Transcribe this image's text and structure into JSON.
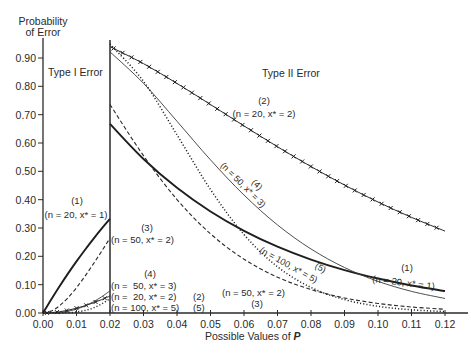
{
  "chart_data": {
    "type": "line",
    "title": "",
    "ylabel": "Probability of Error",
    "xlabel": "Possible Values of P",
    "xlim": [
      0,
      0.12
    ],
    "ylim": [
      0,
      0.9
    ],
    "grid": false,
    "legend": "inline annotations",
    "x_ticks": [
      "0.00",
      "0.01",
      "0.02",
      "0.03",
      "0.04",
      "0.05",
      "0.06",
      "0.07",
      "0.08",
      "0.09",
      "0.10",
      "0.11",
      "0.12"
    ],
    "y_ticks": [
      "0.00",
      "0.10",
      "0.20",
      "0.30",
      "0.40",
      "0.50",
      "0.60",
      "0.70",
      "0.80",
      "0.90"
    ],
    "regions": {
      "boundary_p": 0.02,
      "type_i": "Type I Error",
      "type_ii": "Type II Error"
    },
    "type_i_x": [
      0,
      0.0025,
      0.005,
      0.0075,
      0.01,
      0.0125,
      0.015,
      0.0175,
      0.02
    ],
    "type_ii_x": [
      0.02,
      0.03,
      0.04,
      0.05,
      0.06,
      0.07,
      0.08,
      0.09,
      0.1,
      0.11,
      0.12
    ],
    "series": [
      {
        "id": "(1)",
        "name": "n = 20, x* = 1",
        "n": 20,
        "x_star": 1,
        "style": "thick solid",
        "type_i": [
          0,
          0.0488,
          0.0954,
          0.1398,
          0.1821,
          0.2224,
          0.2609,
          0.2975,
          0.3324
        ],
        "type_ii": [
          0.6676,
          0.5438,
          0.442,
          0.3585,
          0.2901,
          0.2342,
          0.1887,
          0.1516,
          0.1216,
          0.0972,
          0.0776
        ]
      },
      {
        "id": "(2)",
        "name": "n = 20, x* = 2",
        "n": 20,
        "x_star": 2,
        "style": "solid with x markers",
        "type_i": [
          0,
          0.0012,
          0.0045,
          0.0098,
          0.0169,
          0.0256,
          0.0358,
          0.0473,
          0.0599
        ],
        "type_ii": [
          0.9401,
          0.8802,
          0.8103,
          0.7358,
          0.6604,
          0.5868,
          0.5169,
          0.4516,
          0.3917,
          0.3376,
          0.2891
        ]
      },
      {
        "id": "(3)",
        "name": "n = 50, x* = 2",
        "n": 50,
        "x_star": 2,
        "style": "dashed",
        "type_i": [
          0,
          0.0071,
          0.0261,
          0.0544,
          0.0894,
          0.1294,
          0.1727,
          0.2179,
          0.2642
        ],
        "type_ii": [
          0.7358,
          0.5553,
          0.4005,
          0.2794,
          0.19,
          0.1265,
          0.0827,
          0.0532,
          0.0338,
          0.0212,
          0.0132
        ]
      },
      {
        "id": "(4)",
        "name": "n = 50, x* = 3",
        "n": 50,
        "x_star": 3,
        "style": "thin solid",
        "type_i": [
          0,
          0.0003,
          0.0021,
          0.0064,
          0.0138,
          0.0247,
          0.0393,
          0.0572,
          0.0784
        ],
        "type_ii": [
          0.9216,
          0.8108,
          0.6767,
          0.5405,
          0.4163,
          0.3108,
          0.226,
          0.1605,
          0.1117,
          0.0764,
          0.0513
        ]
      },
      {
        "id": "(5)",
        "name": "n = 100, x* = 5",
        "n": 100,
        "x_star": 5,
        "style": "dotted",
        "type_i": [
          0,
          0.0,
          0.0002,
          0.0011,
          0.0034,
          0.0088,
          0.0177,
          0.032,
          0.0508
        ],
        "type_ii": [
          0.9492,
          0.8178,
          0.6289,
          0.436,
          0.2768,
          0.1632,
          0.0903,
          0.0475,
          0.0237,
          0.0113,
          0.0051
        ]
      }
    ],
    "axis_labels": {
      "y_line1": "Probability",
      "y_line2": "of Error",
      "x_main": "Possible Values of ",
      "x_var": "P"
    },
    "annotations": {
      "type_i_label": "Type I Error",
      "type_ii_label": "Type II Error",
      "left_1": {
        "num": "(1)",
        "text": "(n = 20, x* = 1)"
      },
      "left_3": {
        "num": "(3)",
        "text": "(n = 50, x* = 2)"
      },
      "left_4": {
        "num": "(4)",
        "lines": [
          "(n =  50, x* = 3)",
          "(n =  20, x* = 2)",
          "(n = 100, x* = 5)"
        ],
        "suffixes": [
          "",
          "(2)",
          "(5)"
        ]
      },
      "top_2": {
        "num": "(2)",
        "text": "(n = 20, x* = 2)"
      },
      "diag_4": {
        "num": "(4)",
        "text": "(n = 50, x* = 3)"
      },
      "diag_5": {
        "num": "(5)",
        "text": "(n = 100, x* = 5)"
      },
      "right_1": {
        "num": "(1)",
        "text": "(n = 20, x* = 1)"
      },
      "bottom_3": {
        "num": "(3)",
        "text": "(n = 50, x* = 2)"
      }
    }
  }
}
